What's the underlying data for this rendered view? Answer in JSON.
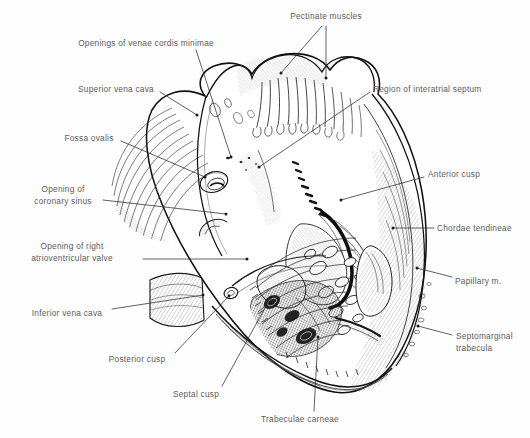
{
  "figure": {
    "style": "pen-and-ink anatomical line drawing with hatch shading",
    "background_color": "#fefefe",
    "ink_color": "#1a1a1a",
    "label_text_color": "#5c5c5c",
    "leader_line_color": "#2b2b2b",
    "width": 530,
    "height": 438
  },
  "labels": [
    {
      "id": "pectinate-muscles",
      "text": "Pectinate muscles",
      "align": "center",
      "x": 326,
      "y": 11,
      "leaders": [
        {
          "path": "M 326,26 L 326,78"
        },
        {
          "path": "M 322,26 L 281,73"
        }
      ]
    },
    {
      "id": "openings-venae-cordis-minimae",
      "text": "Openings of venae cordis minimae",
      "align": "center",
      "x": 146,
      "y": 38,
      "leaders": [
        {
          "path": "M 196,50 L 231,157"
        }
      ]
    },
    {
      "id": "superior-vena-cava",
      "text": "Superior vena cava",
      "align": "center",
      "x": 116,
      "y": 84,
      "leaders": [
        {
          "path": "M 160,92 L 197,115"
        }
      ]
    },
    {
      "id": "region-of-interatrial-septum",
      "text": "Region of interatrial septum",
      "align": "left",
      "x": 373,
      "y": 84,
      "leaders": [
        {
          "path": "M 370,92 L 259,167"
        }
      ]
    },
    {
      "id": "fossa-ovalis",
      "text": "Fossa ovalis",
      "align": "center",
      "x": 89,
      "y": 133,
      "leaders": [
        {
          "path": "M 121,141 L 205,177"
        }
      ]
    },
    {
      "id": "anterior-cusp",
      "text": "Anterior cusp",
      "align": "left",
      "x": 428,
      "y": 169,
      "leaders": [
        {
          "path": "M 424,177 L 341,200"
        }
      ]
    },
    {
      "id": "opening-of-coronary-sinus",
      "text": "Opening of\ncoronary sinus",
      "align": "center",
      "x": 63,
      "y": 184,
      "leaders": [
        {
          "path": "M 103,200 L 226,214"
        }
      ]
    },
    {
      "id": "chordae-tendineae",
      "text": "Chordae tendineae",
      "align": "left",
      "x": 437,
      "y": 223,
      "leaders": [
        {
          "path": "M 434,228 L 393,228"
        }
      ]
    },
    {
      "id": "opening-of-right-atrioventricular-valve",
      "text": "Opening of right\natrioventricular valve",
      "align": "center",
      "x": 72,
      "y": 241,
      "leaders": [
        {
          "path": "M 143,259 L 247,259"
        }
      ]
    },
    {
      "id": "papillary-m",
      "text": "Papillary m.",
      "align": "left",
      "x": 455,
      "y": 276,
      "leaders": [
        {
          "path": "M 452,277 L 417,268"
        }
      ]
    },
    {
      "id": "inferior-vena-cava",
      "text": "Inferior vena cava",
      "align": "center",
      "x": 67,
      "y": 308,
      "leaders": [
        {
          "path": "M 112,309 L 203,295"
        }
      ]
    },
    {
      "id": "septomarginal-trabecula",
      "text": "Septomarginal\ntrabecula",
      "align": "left",
      "x": 456,
      "y": 331,
      "leaders": [
        {
          "path": "M 452,335 L 418,326"
        }
      ]
    },
    {
      "id": "posterior-cusp",
      "text": "Posterior cusp",
      "align": "center",
      "x": 137,
      "y": 354,
      "leaders": [
        {
          "path": "M 175,353 L 229,296"
        }
      ]
    },
    {
      "id": "septal-cusp",
      "text": "Septal cusp",
      "align": "center",
      "x": 196,
      "y": 389,
      "leaders": [
        {
          "path": "M 222,386 L 271,297"
        }
      ]
    },
    {
      "id": "trabeculae-carneae",
      "text": "Trabeculae carneae",
      "align": "center",
      "x": 300,
      "y": 414,
      "leaders": [
        {
          "path": "M 314,411 L 318,337"
        }
      ]
    }
  ],
  "structures": [
    {
      "id": "superior-vena-cava-stump",
      "name": "Superior vena cava stump"
    },
    {
      "id": "inferior-vena-cava-stump",
      "name": "Inferior vena cava stump"
    },
    {
      "id": "right-atrium-wall",
      "name": "Right atrium wall (reflected)"
    },
    {
      "id": "right-auricle",
      "name": "Right auricle with pectinate muscles"
    },
    {
      "id": "fossa-ovalis-depression",
      "name": "Fossa ovalis depression"
    },
    {
      "id": "coronary-sinus-opening",
      "name": "Coronary sinus opening"
    },
    {
      "id": "tricuspid-valve-ring",
      "name": "Right atrioventricular (tricuspid) orifice"
    },
    {
      "id": "anterior-cusp-leaflet",
      "name": "Anterior cusp leaflet"
    },
    {
      "id": "posterior-cusp-leaflet",
      "name": "Posterior cusp leaflet"
    },
    {
      "id": "septal-cusp-leaflet",
      "name": "Septal cusp leaflet"
    },
    {
      "id": "chordae-tendineae-strands",
      "name": "Chordae tendineae strands"
    },
    {
      "id": "papillary-muscle-body",
      "name": "Papillary muscle"
    },
    {
      "id": "septomarginal-trabecula-band",
      "name": "Septomarginal trabecula (moderator band)"
    },
    {
      "id": "trabeculae-carneae-mesh",
      "name": "Trabeculae carneae meshwork"
    },
    {
      "id": "ventricle-apex",
      "name": "Right ventricle apex"
    },
    {
      "id": "ventricle-outer-wall",
      "name": "Cut outer wall of right ventricle"
    }
  ]
}
